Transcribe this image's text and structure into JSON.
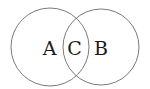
{
  "diagram": {
    "type": "venn",
    "stroke_color": "#7a7a7a",
    "circles": [
      {
        "name": "left",
        "label": "A",
        "cx": 50,
        "cy": 47,
        "r": 39
      },
      {
        "name": "right",
        "label": "B",
        "cx": 101,
        "cy": 47,
        "r": 38
      }
    ],
    "labels": {
      "a": "A",
      "c": "C",
      "b": "B"
    }
  }
}
